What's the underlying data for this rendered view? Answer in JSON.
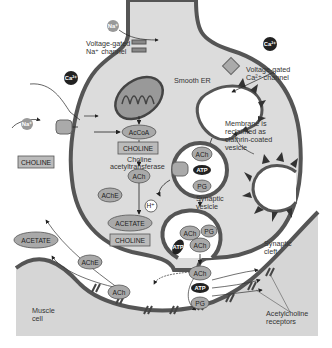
{
  "diagram": {
    "colors": {
      "membrane": "#555555",
      "cytoplasm": "#dcdcdc",
      "muscle": "#d6d6d6",
      "molecule": "#a9a9a9",
      "dark_molecule": "#222222",
      "background": "#ffffff"
    },
    "labels": {
      "na_channel": [
        "Voltage-gated",
        "Na⁺ channel"
      ],
      "ca_channel": [
        "Voltage-gated",
        "Ca²⁺ channel"
      ],
      "smooth_er": "Smooth ER",
      "membrane_reclaimed": [
        "Membrane is",
        "reclaimed as",
        "clathrin-coated",
        "vesicle"
      ],
      "choline_acetyltransferase": [
        "Choline",
        "acetyltransferase"
      ],
      "synaptic_vesicle": [
        "Synaptic",
        "vesicle"
      ],
      "synaptic_cleft": [
        "Synaptic",
        "cleft"
      ],
      "muscle_cell": [
        "Muscle",
        "cell"
      ],
      "ach_receptors": [
        "Acetylcholine",
        "receptors"
      ]
    },
    "ions": {
      "na_top": "Na⁺",
      "na_left": "Na⁺",
      "ca_left": "Ca²⁺",
      "ca_right": "Ca²⁺",
      "h_plus": "H⁺"
    },
    "molecules": {
      "accoa": "AcCoA",
      "choline_inside": "CHOLINE",
      "choline_outside": "CHOLINE",
      "choline_lower": "CHOLINE",
      "ach_cytosol": "ACh",
      "ache_inside": "AChE",
      "ache_cleft": "AChE",
      "acetate_inside": "ACETATE",
      "acetate_outside": "ACETATE",
      "vesicle_ach": "ACh",
      "vesicle_atp": "ATP",
      "vesicle_pg": "PG",
      "fusing_ach_1": "ACh",
      "fusing_pg": "PG",
      "fusing_atp": "ATP",
      "fusing_ach_2": "ACh",
      "released_ach": "ACh",
      "released_atp": "ATP",
      "released_pg": "PG",
      "bound_ach": "ACh"
    }
  }
}
